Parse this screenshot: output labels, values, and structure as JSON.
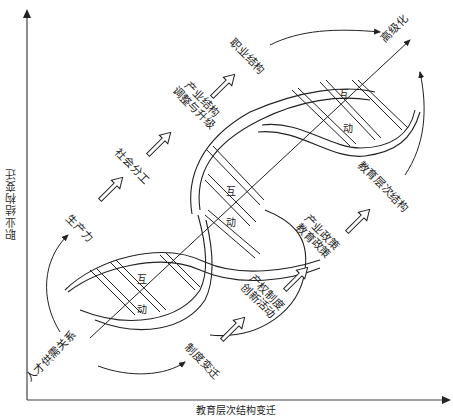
{
  "axes": {
    "y_label": "职业结构变迁",
    "x_label": "教育层次结构变迁"
  },
  "diagonal_axis": {
    "start_label": "人才供需关系",
    "end_label": "高级化"
  },
  "upper_chain": [
    {
      "label": "生产力"
    },
    {
      "label": "社会分工"
    },
    {
      "label_line1": "产业结构",
      "label_line2": "调整与升级"
    },
    {
      "label": "职业结构"
    }
  ],
  "lower_chain": [
    {
      "label": "制度变迁"
    },
    {
      "label_line1": "产权制度",
      "label_line2": "创新活动"
    },
    {
      "label_line1": "产业政策",
      "label_line2": "教育政策"
    },
    {
      "label": "教育层次结构"
    }
  ],
  "helix_segments": [
    {
      "top": "互",
      "bottom": "动"
    },
    {
      "top": "互",
      "bottom": "动"
    },
    {
      "top": "互",
      "bottom": "动"
    }
  ],
  "colors": {
    "line": "#222222",
    "background": "#ffffff"
  }
}
